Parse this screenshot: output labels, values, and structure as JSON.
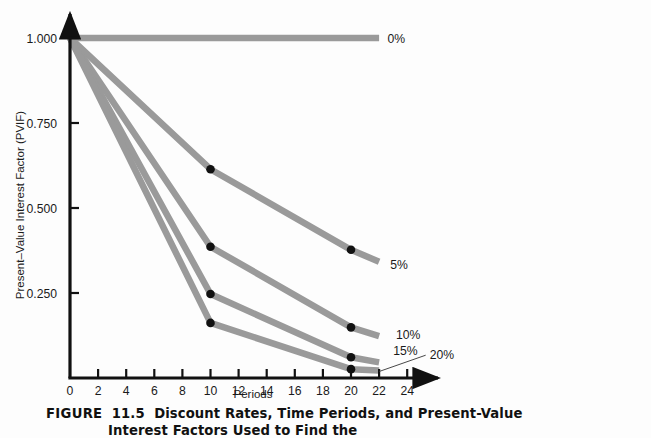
{
  "figure": {
    "caption_label": "FIGURE",
    "caption_number": "11.5",
    "caption_line1": "Discount Rates, Time Periods, and Present-Value",
    "caption_line2": "Interest Factors Used to Find the"
  },
  "colors": {
    "line": "#9a9a9a",
    "axis": "#111111",
    "marker": "#111111",
    "text": "#1a1a1a",
    "background": "#fdfdfd"
  },
  "chart_data": {
    "type": "line",
    "title": "",
    "subtitle": "",
    "xlabel": "Periods",
    "ylabel": "Present–Value Interest Factor (PVIF)",
    "xlim": [
      0,
      25
    ],
    "ylim": [
      0,
      1.0
    ],
    "xticks": [
      0,
      2,
      4,
      6,
      8,
      10,
      12,
      14,
      16,
      18,
      20,
      22,
      24
    ],
    "xticklabels": [
      "0",
      "2",
      "4",
      "6",
      "8",
      "10",
      "12",
      "14",
      "16",
      "18",
      "20",
      "22",
      "24"
    ],
    "yticks": [
      0.25,
      0.5,
      0.75,
      1.0
    ],
    "yticklabels": [
      "0.250",
      "0.500",
      "0.750",
      "1.000"
    ],
    "grid": false,
    "legend_position": "right-inline",
    "x": [
      0,
      10,
      20,
      22
    ],
    "series": [
      {
        "name": "0%",
        "label": "0%",
        "values": [
          1.0,
          1.0,
          1.0,
          1.0
        ],
        "markers": [],
        "label_x": 22.6,
        "label_y": 1.0
      },
      {
        "name": "5%",
        "label": "5%",
        "values": [
          1.0,
          0.614,
          0.377,
          0.342
        ],
        "markers": [
          {
            "x": 10,
            "y": 0.614
          },
          {
            "x": 20,
            "y": 0.377
          }
        ],
        "label_x": 22.8,
        "label_y": 0.335
      },
      {
        "name": "10%",
        "label": "10%",
        "values": [
          1.0,
          0.386,
          0.149,
          0.123
        ],
        "markers": [
          {
            "x": 10,
            "y": 0.386
          },
          {
            "x": 20,
            "y": 0.149
          }
        ],
        "label_x": 23.2,
        "label_y": 0.129
      },
      {
        "name": "15%",
        "label": "15%",
        "values": [
          1.0,
          0.247,
          0.061,
          0.046
        ],
        "markers": [
          {
            "x": 10,
            "y": 0.247
          },
          {
            "x": 20,
            "y": 0.061
          }
        ],
        "label_x": 23.0,
        "label_y": 0.082
      },
      {
        "name": "20%",
        "label": "20%",
        "values": [
          1.0,
          0.162,
          0.026,
          0.022
        ],
        "markers": [
          {
            "x": 10,
            "y": 0.162
          },
          {
            "x": 20,
            "y": 0.026
          }
        ],
        "label_x": 25.6,
        "label_y": 0.07,
        "leader": true
      }
    ]
  }
}
